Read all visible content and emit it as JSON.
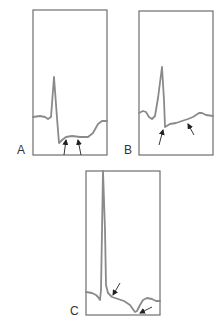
{
  "figure": {
    "colors": {
      "frame": "#6e6e6e",
      "trace": "#8a8a8a",
      "arrow": "#222222",
      "label": "#333333"
    },
    "panels": [
      {
        "id": "A",
        "label": "A",
        "frame": {
          "x": 33,
          "y": 10,
          "w": 74,
          "h": 145
        },
        "label_pos": {
          "x": 17,
          "y": 144
        },
        "trace": "M33,117 L40,116 L45,117 L48,119 L51,117 L54,77 L57,118 L59,143 L62,140 L66,137 L72,136 L80,137 L88,137 L93,133 L98,124 L102,121 L107,121",
        "arrows": [
          {
            "from": [
              64,
              155
            ],
            "to": [
              66,
              140
            ]
          },
          {
            "from": [
              81,
              155
            ],
            "to": [
              78,
              140
            ]
          }
        ]
      },
      {
        "id": "B",
        "label": "B",
        "frame": {
          "x": 139,
          "y": 11,
          "w": 74,
          "h": 144
        },
        "label_pos": {
          "x": 124,
          "y": 144
        },
        "trace": "M139,113 L143,111 L146,112 L149,117 L152,119 L155,116 L158,98 L162,67 L164,100 L165,127 L170,124 L176,123 L182,121 L188,119 L193,117 L199,113 L202,113 L206,115 L213,116",
        "arrows": [
          {
            "from": [
              159,
              145
            ],
            "to": [
              163,
              130
            ]
          },
          {
            "from": [
              194,
              135
            ],
            "to": [
              188,
              124
            ]
          }
        ]
      },
      {
        "id": "C",
        "label": "C",
        "frame": {
          "x": 86,
          "y": 171,
          "w": 74,
          "h": 144
        },
        "label_pos": {
          "x": 70,
          "y": 305
        },
        "trace": "M86,292 L92,293 L96,295 L98,297 L100,300 L101,290 L103,171 L105,230 L106,285 L108,293 L112,297 L118,299 L124,301 L130,305 L135,312 L137,311 L140,305 L143,300 L147,298 L152,299 L156,301 L160,301",
        "arrows": [
          {
            "from": [
              120,
              283
            ],
            "to": [
              113,
              295
            ]
          },
          {
            "from": [
              152,
              307
            ],
            "to": [
              140,
              313
            ]
          }
        ]
      }
    ]
  }
}
